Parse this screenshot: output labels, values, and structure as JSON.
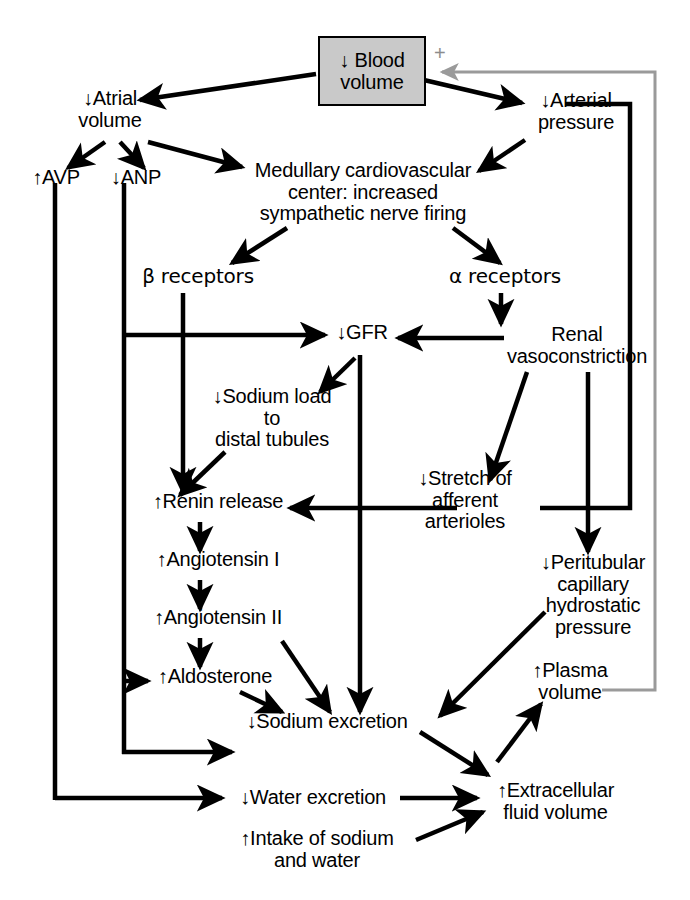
{
  "diagram": {
    "colors": {
      "line": "#000000",
      "feedback_line": "#9a9a9a",
      "box_fill": "#c9c9c9",
      "box_border": "#000000",
      "text": "#000000"
    },
    "feedback_sign": "+"
  },
  "nodes": {
    "blood_volume": "↓ Blood\nvolume",
    "atrial_volume": "↓Atrial\nvolume",
    "arterial_pressure": "↓Arterial\npressure",
    "avp": "↑AVP",
    "anp": "↓ANP",
    "medullary_center": "Medullary cardiovascular\ncenter: increased\nsympathetic nerve firing",
    "beta_receptors": "β receptors",
    "alpha_receptors": "α receptors",
    "gfr": "↓GFR",
    "renal_vasoconstriction": "Renal\nvasoconstriction",
    "sodium_load": "↓Sodium load\nto\ndistal tubules",
    "stretch_afferent": "↓Stretch of\nafferent\narterioles",
    "renin_release": "↑Renin release",
    "angiotensin_i": "↑Angiotensin I",
    "angiotensin_ii": "↑Angiotensin II",
    "aldosterone": "↑Aldosterone",
    "peritubular": "↓Peritubular\ncapillary\nhydrostatic\npressure",
    "plasma_volume": "↑Plasma\nvolume",
    "sodium_excretion": "↓Sodium excretion",
    "water_excretion": "↓Water excretion",
    "extracellular_fluid": "↑Extracellular\nfluid volume",
    "intake": "↑Intake of sodium\nand water"
  },
  "edges": [
    {
      "from": "blood_volume",
      "to": "atrial_volume",
      "style": "solid-black"
    },
    {
      "from": "blood_volume",
      "to": "arterial_pressure",
      "style": "solid-black"
    },
    {
      "from": "atrial_volume",
      "to": "avp",
      "style": "solid-black"
    },
    {
      "from": "atrial_volume",
      "to": "anp",
      "style": "solid-black"
    },
    {
      "from": "atrial_volume",
      "to": "medullary_center",
      "style": "solid-black"
    },
    {
      "from": "arterial_pressure",
      "to": "medullary_center",
      "style": "solid-black"
    },
    {
      "from": "medullary_center",
      "to": "beta_receptors",
      "style": "solid-black"
    },
    {
      "from": "medullary_center",
      "to": "alpha_receptors",
      "style": "solid-black"
    },
    {
      "from": "beta_receptors",
      "to": "renin_release",
      "style": "solid-black"
    },
    {
      "from": "alpha_receptors",
      "to": "renal_vasoconstriction",
      "style": "solid-black"
    },
    {
      "from": "renal_vasoconstriction",
      "to": "gfr",
      "style": "solid-black"
    },
    {
      "from": "anp",
      "to": "gfr",
      "style": "solid-black"
    },
    {
      "from": "gfr",
      "to": "sodium_load",
      "style": "solid-black"
    },
    {
      "from": "gfr",
      "to": "sodium_excretion",
      "style": "solid-black"
    },
    {
      "from": "sodium_load",
      "to": "renin_release",
      "style": "solid-black"
    },
    {
      "from": "renal_vasoconstriction",
      "to": "stretch_afferent",
      "style": "solid-black"
    },
    {
      "from": "arterial_pressure",
      "to": "stretch_afferent",
      "style": "solid-black"
    },
    {
      "from": "stretch_afferent",
      "to": "renin_release",
      "style": "solid-black"
    },
    {
      "from": "renin_release",
      "to": "angiotensin_i",
      "style": "solid-black"
    },
    {
      "from": "angiotensin_i",
      "to": "angiotensin_ii",
      "style": "solid-black"
    },
    {
      "from": "angiotensin_ii",
      "to": "aldosterone",
      "style": "solid-black"
    },
    {
      "from": "angiotensin_ii",
      "to": "sodium_excretion",
      "style": "solid-black"
    },
    {
      "from": "aldosterone",
      "to": "sodium_excretion",
      "style": "solid-black"
    },
    {
      "from": "anp",
      "to": "aldosterone",
      "style": "solid-black"
    },
    {
      "from": "anp",
      "to": "sodium_excretion",
      "style": "solid-black"
    },
    {
      "from": "avp",
      "to": "water_excretion",
      "style": "solid-black"
    },
    {
      "from": "renal_vasoconstriction",
      "to": "peritubular",
      "style": "solid-black"
    },
    {
      "from": "peritubular",
      "to": "sodium_excretion",
      "style": "solid-black"
    },
    {
      "from": "sodium_excretion",
      "to": "extracellular_fluid",
      "style": "solid-black"
    },
    {
      "from": "water_excretion",
      "to": "extracellular_fluid",
      "style": "solid-black"
    },
    {
      "from": "intake",
      "to": "extracellular_fluid",
      "style": "solid-black"
    },
    {
      "from": "extracellular_fluid",
      "to": "plasma_volume",
      "style": "solid-black"
    },
    {
      "from": "plasma_volume",
      "to": "blood_volume",
      "style": "solid-gray-feedback"
    }
  ]
}
